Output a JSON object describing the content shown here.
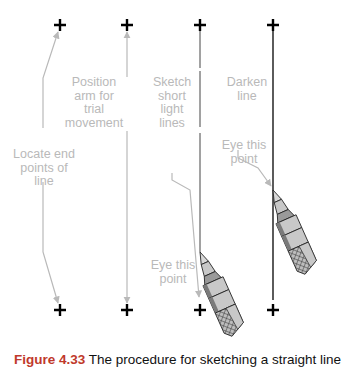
{
  "figure": {
    "steps": [
      {
        "id": "step-1",
        "label": "Locate end\npoints of\nline",
        "top_point": [
          60,
          25
        ],
        "bottom_point": [
          60,
          310
        ]
      },
      {
        "id": "step-2",
        "label": "Position\narm for\ntrial\nmovement",
        "top_point": [
          127,
          25
        ],
        "bottom_point": [
          127,
          310
        ]
      },
      {
        "id": "step-3",
        "label": "Sketch\nshort\nlight\nlines",
        "eye_label": "Eye this\npoint",
        "top_point": [
          200,
          25
        ],
        "bottom_point": [
          200,
          310
        ]
      },
      {
        "id": "step-4",
        "label": "Darken\nline",
        "eye_label": "Eye this\npoint",
        "top_point": [
          273,
          25
        ],
        "bottom_point": [
          273,
          310
        ]
      }
    ],
    "colors": {
      "annotation": "#b9b9b9",
      "marker": "#000000",
      "line": "#333333",
      "pencil_fill": "#c8c8c8",
      "pencil_dark": "#7a7a7a"
    },
    "caption": {
      "number": "Figure 4.33",
      "text": "The procedure for sketching a straight line"
    }
  }
}
